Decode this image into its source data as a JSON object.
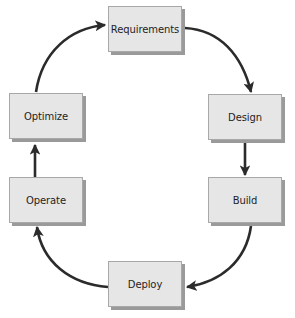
{
  "diagram": {
    "type": "cycle",
    "colors": {
      "box_fill": "#e6e6e6",
      "box_border": "#a8a8a8",
      "box_shadow": "#9a9a9a",
      "arrow": "#2b2b2b",
      "text": "#1e1e1e"
    },
    "nodes": [
      {
        "id": "requirements",
        "label": "Requirements"
      },
      {
        "id": "design",
        "label": "Design"
      },
      {
        "id": "build",
        "label": "Build"
      },
      {
        "id": "deploy",
        "label": "Deploy"
      },
      {
        "id": "operate",
        "label": "Operate"
      },
      {
        "id": "optimize",
        "label": "Optimize"
      }
    ],
    "edges": [
      {
        "from": "requirements",
        "to": "design"
      },
      {
        "from": "design",
        "to": "build"
      },
      {
        "from": "build",
        "to": "deploy"
      },
      {
        "from": "deploy",
        "to": "operate"
      },
      {
        "from": "operate",
        "to": "optimize"
      },
      {
        "from": "optimize",
        "to": "requirements"
      }
    ]
  }
}
